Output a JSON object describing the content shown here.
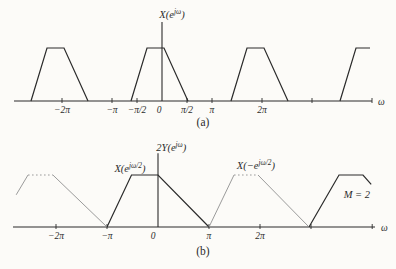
{
  "figure": {
    "bg": "#fcfbf8",
    "ink": "#2b2b2b",
    "grey": "#9b9b9b",
    "caption_a": "(a)",
    "caption_b": "(b)"
  },
  "chart_data": [
    {
      "id": "a",
      "type": "line",
      "title": "X(e^{jω})",
      "xlabel": "ω",
      "x_unit": "multiples of π",
      "ylim": [
        0,
        1
      ],
      "xlim_pi": [
        -2.96,
        4.2
      ],
      "grid": false,
      "omega_label": "ω",
      "caption": "(a)",
      "ticks": [
        {
          "x": -2,
          "label": "−2π"
        },
        {
          "x": -1,
          "label": "−π"
        },
        {
          "x": -0.5,
          "label": "−π/2"
        },
        {
          "x": 0,
          "label": "0",
          "no_mark": true,
          "dx": -3
        },
        {
          "x": 0.5,
          "label": "π/2"
        },
        {
          "x": 1,
          "label": "π"
        },
        {
          "x": 2,
          "label": "2π"
        },
        {
          "x": 3,
          "label": ""
        },
        {
          "x": 4.2,
          "label": ""
        }
      ],
      "series": [
        {
          "name": "X(e^jω) replica at −2π",
          "style": "solid-dark",
          "points": [
            [
              -2.62,
              0
            ],
            [
              -2.3,
              1
            ],
            [
              -1.96,
              1
            ],
            [
              -1.48,
              0
            ]
          ]
        },
        {
          "name": "X(e^jω) baseband trapezoid",
          "style": "solid-dark",
          "points": [
            [
              -0.62,
              0
            ],
            [
              -0.3,
              1
            ],
            [
              0.04,
              1
            ],
            [
              0.52,
              0
            ]
          ]
        },
        {
          "name": "X(e^jω) replica at 2π",
          "style": "solid-dark",
          "points": [
            [
              1.38,
              0
            ],
            [
              1.7,
              1
            ],
            [
              2.04,
              1
            ],
            [
              2.52,
              0
            ]
          ]
        },
        {
          "name": "X(e^jω) replica at 4π (truncated at edge)",
          "style": "solid-dark",
          "points": [
            [
              3.56,
              0
            ],
            [
              3.88,
              1
            ],
            [
              4.16,
              1
            ]
          ]
        }
      ],
      "annotations": [
        {
          "text": "X(e^{jω})",
          "x": 0.2,
          "y": 1.57
        }
      ]
    },
    {
      "id": "b",
      "type": "line",
      "title": "2Y(e^{jω})",
      "xlabel": "ω",
      "x_unit": "multiples of π",
      "ylim": [
        0,
        1
      ],
      "xlim_pi": [
        -2.84,
        4.25
      ],
      "grid": false,
      "omega_label": "ω",
      "caption": "(b)",
      "ticks": [
        {
          "x": -2,
          "label": "−2π"
        },
        {
          "x": -1,
          "label": "−π"
        },
        {
          "x": 0,
          "label": "0",
          "no_mark": true,
          "dx": -5
        },
        {
          "x": 1,
          "label": "π"
        },
        {
          "x": 2,
          "label": "2π"
        },
        {
          "x": 3,
          "label": ""
        },
        {
          "x": 4.2,
          "label": ""
        }
      ],
      "series": [
        {
          "name": "X(−e^{jω/2}) replica at −2π rising edge (truncated)",
          "style": "solid-grey",
          "points": [
            [
              -2.78,
              0.62
            ],
            [
              -2.55,
              1
            ]
          ]
        },
        {
          "name": "X(−e^{jω/2}) replica at −2π flat top",
          "style": "dashed-grey",
          "points": [
            [
              -2.55,
              1
            ],
            [
              -2.06,
              1
            ]
          ]
        },
        {
          "name": "X(−e^{jω/2}) replica at −2π falling edge",
          "style": "solid-grey",
          "points": [
            [
              -2.06,
              1
            ],
            [
              -1,
              0
            ]
          ]
        },
        {
          "name": "X(e^{jω/2}) baseband trapezoid",
          "style": "solid-dark",
          "points": [
            [
              -1,
              0
            ],
            [
              -0.52,
              1
            ],
            [
              0,
              1
            ],
            [
              1,
              0
            ]
          ]
        },
        {
          "name": "X(−e^{jω/2}) replica at 2π rising edge",
          "style": "solid-grey",
          "points": [
            [
              1,
              0
            ],
            [
              1.49,
              1
            ]
          ]
        },
        {
          "name": "X(−e^{jω/2}) replica at 2π flat top",
          "style": "dashed-grey",
          "points": [
            [
              1.49,
              1
            ],
            [
              1.96,
              1
            ]
          ]
        },
        {
          "name": "X(−e^{jω/2}) replica at 2π falling edge",
          "style": "solid-grey",
          "points": [
            [
              1.96,
              1
            ],
            [
              2.96,
              0
            ]
          ]
        },
        {
          "name": "X(e^{jω/2}) replica at 4π (truncated at edge)",
          "style": "solid-dark",
          "points": [
            [
              2.96,
              0
            ],
            [
              3.55,
              1
            ],
            [
              4.02,
              1
            ],
            [
              4.18,
              0.82
            ]
          ]
        }
      ],
      "annotations": [
        {
          "text": "2Y(e^{jω})",
          "x": 0.26,
          "y": 1.46
        },
        {
          "text": "X(e^{jω/2})",
          "x": -0.55,
          "y": 1.06
        },
        {
          "text": "X(−e^{jω/2})",
          "x": 1.92,
          "y": 1.12
        },
        {
          "text": "M = 2",
          "x": 3.9,
          "y": 0.56
        }
      ]
    }
  ]
}
